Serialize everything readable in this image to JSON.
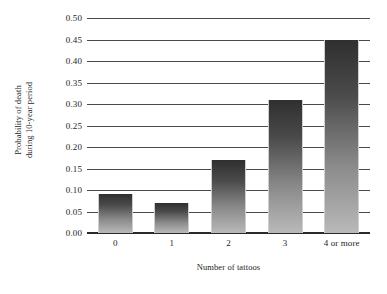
{
  "chart_data": {
    "type": "bar",
    "title": "",
    "subtitle": "",
    "xlabel": "Number of tattoos",
    "ylabel_line1": "Probability of death",
    "ylabel_line2": "during 10-year period",
    "ylabel": "Probability of death during 10-year period",
    "categories": [
      "0",
      "1",
      "2",
      "3",
      "4 or more"
    ],
    "values": [
      0.09,
      0.07,
      0.17,
      0.31,
      0.45
    ],
    "ylim": [
      0.0,
      0.5
    ],
    "ytick_labels": [
      "0.50",
      "0.45",
      "0.40",
      "0.35",
      "0.30",
      "0.25",
      "0.20",
      "0.15",
      "0.10",
      "0.05",
      "0.00"
    ],
    "ytick_values": [
      0.5,
      0.45,
      0.4,
      0.35,
      0.3,
      0.25,
      0.2,
      0.15,
      0.1,
      0.05,
      0.0
    ],
    "ytick_step": 0.05,
    "grid": true,
    "grid_axis": "y",
    "legend": false,
    "legend_position": "none",
    "bar_gradient_top_color": "#2f2f2f",
    "bar_gradient_bottom_color": "#b9b9b9",
    "axis_color": "#2a2a2a",
    "grid_color": "#4a4a4a",
    "background_color": "#ffffff",
    "text_color": "#1d1d1d"
  }
}
